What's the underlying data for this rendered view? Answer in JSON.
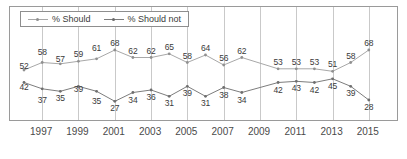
{
  "chart_data": {
    "type": "line",
    "title": "",
    "xlabel": "",
    "ylabel": "",
    "xlim": [
      1996,
      2016
    ],
    "ylim": [
      20,
      72
    ],
    "grid": "vertical",
    "legend_position": "top-left",
    "x": [
      1996,
      1997,
      1998,
      1999,
      2000,
      2001,
      2002,
      2003,
      2004,
      2005,
      2006,
      2007,
      2008,
      2010,
      2011,
      2012,
      2013,
      2014,
      2015
    ],
    "xticks": [
      "1997",
      "1999",
      "2001",
      "2003",
      "2005",
      "2007",
      "2009",
      "2011",
      "2013",
      "2015"
    ],
    "xtick_values": [
      1997,
      1999,
      2001,
      2003,
      2005,
      2007,
      2009,
      2011,
      2013,
      2015
    ],
    "series": [
      {
        "name": "% Should",
        "color": "#a8a8a8",
        "values": [
          52,
          58,
          57,
          59,
          61,
          68,
          62,
          62,
          65,
          58,
          64,
          56,
          62,
          53,
          53,
          53,
          51,
          58,
          68
        ],
        "label_side": "above"
      },
      {
        "name": "% Should not",
        "color": "#7d7d7d",
        "values": [
          42,
          37,
          35,
          39,
          35,
          27,
          34,
          36,
          31,
          39,
          31,
          38,
          34,
          42,
          43,
          42,
          45,
          39,
          28
        ],
        "label_side": "below"
      }
    ]
  },
  "legend": {
    "items": [
      {
        "label": "% Should",
        "color": "#a8a8a8"
      },
      {
        "label": "% Should not",
        "color": "#7d7d7d"
      }
    ]
  },
  "colors": {
    "should": "#a8a8a8",
    "should_not": "#7d7d7d",
    "grid": "#c9c9c9",
    "border": "#9a9a9a",
    "text": "#3a3a3a"
  }
}
